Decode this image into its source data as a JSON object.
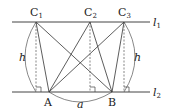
{
  "diagram": {
    "lines": {
      "l1": {
        "label": "l",
        "sub": "1"
      },
      "l2": {
        "label": "l",
        "sub": "2"
      }
    },
    "points": {
      "C1": {
        "label": "C",
        "sub": "1"
      },
      "C2": {
        "label": "C",
        "sub": "2"
      },
      "C3": {
        "label": "C",
        "sub": "3"
      },
      "A": {
        "label": "A"
      },
      "B": {
        "label": "B"
      }
    },
    "height_label_left": "h",
    "height_label_right": "h",
    "base_label": "a",
    "colors": {
      "stroke": "#333333",
      "text": "#222222"
    }
  }
}
